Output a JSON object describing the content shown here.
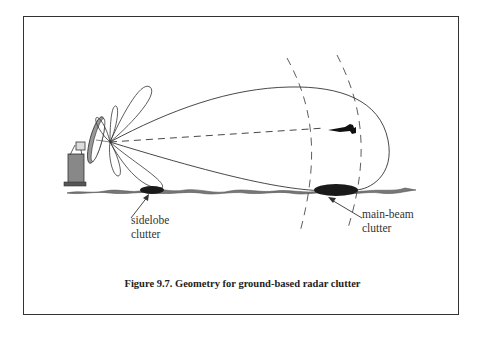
{
  "figure": {
    "caption": "Figure 9.7. Geometry for ground-based radar clutter",
    "labels": {
      "sidelobe_line1": "sidelobe",
      "sidelobe_line2": "clutter",
      "mainbeam_line1": "main-beam",
      "mainbeam_line2": "clutter"
    },
    "elements": [
      "radar-antenna",
      "main-beam-lobe",
      "sidelobes",
      "boresight-line",
      "target-aircraft",
      "range-gate-arcs",
      "ground-terrain",
      "sidelobe-clutter-patch",
      "main-beam-clutter-patch"
    ],
    "colors": {
      "line": "#333333",
      "fill_dark": "#1a1a1a",
      "terrain": "#777777"
    }
  }
}
